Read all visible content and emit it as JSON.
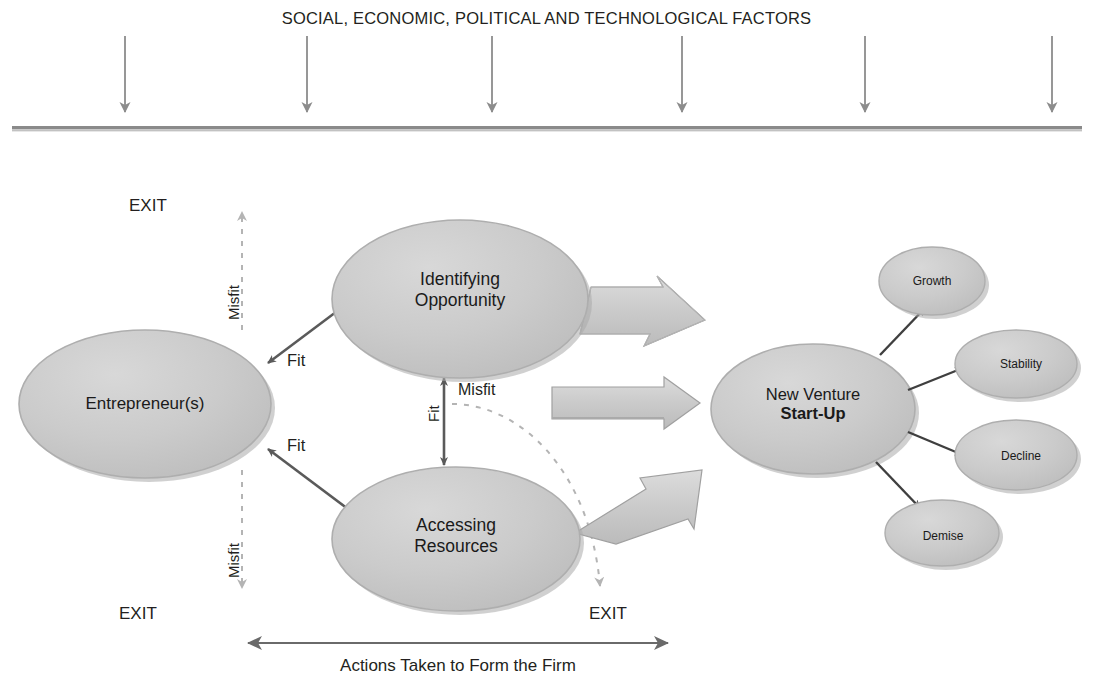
{
  "title": "SOCIAL, ECONOMIC, POLITICAL AND TECHNOLOGICAL FACTORS",
  "environment": {
    "arrow_count": 6,
    "arrow_color": "#8c8c8c",
    "baseline_color": "#767676"
  },
  "nodes": {
    "entrepreneur": {
      "label": "Entrepreneur(s)"
    },
    "identifying": {
      "line1": "Identifying",
      "line2": "Opportunity"
    },
    "accessing": {
      "line1": "Accessing",
      "line2": "Resources"
    },
    "startup": {
      "line1": "New Venture",
      "line2": "Start-Up"
    },
    "outcomes": [
      {
        "label": "Growth"
      },
      {
        "label": "Stability"
      },
      {
        "label": "Decline"
      },
      {
        "label": "Demise"
      }
    ]
  },
  "labels": {
    "exit_top": "EXIT",
    "exit_bottom_left": "EXIT",
    "exit_bottom_right": "EXIT",
    "misfit_top": "Misfit",
    "misfit_bottom": "Misfit",
    "misfit_center": "Misfit",
    "fit_upper": "Fit",
    "fit_lower": "Fit",
    "fit_center": "Fit",
    "actions": "Actions Taken to Form the Firm"
  },
  "colors": {
    "ellipse_fill": "#c9c9c9",
    "ellipse_stroke": "#a8a8a8",
    "ellipse_shadow": "#9a9a9a",
    "block_arrow_fill": "#cfcfcf",
    "block_arrow_stroke": "#a0a0a0",
    "thin_arrow": "#5a5a5a",
    "dashed_arrow": "#b0b0b0",
    "text": "#231f20"
  }
}
